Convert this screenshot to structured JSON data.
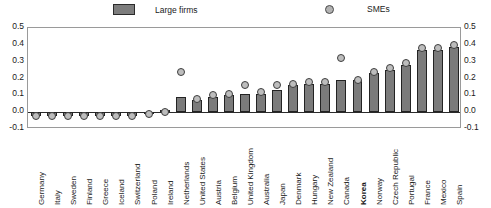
{
  "chart_data": {
    "type": "bar",
    "title": "",
    "subtitle": "",
    "xlabel": "",
    "ylabel": "",
    "ylim": [
      -0.1,
      0.5
    ],
    "yticks": [
      0.5,
      0.4,
      0.3,
      0.2,
      0.1,
      0.0,
      -0.1
    ],
    "ytick_labels": [
      "0.5",
      "0.4",
      "0.3",
      "0.2",
      "0.1",
      "0.0",
      "-0.1"
    ],
    "ytick_labels_right": [
      "0.5",
      "0.4",
      "0.3",
      "0.2",
      "0.1",
      "0.0",
      "-0.1"
    ],
    "grid": false,
    "dual_axis": true,
    "legend_position": "top",
    "categories": [
      "Germany",
      "Italy",
      "Sweden",
      "Finland",
      "Greece",
      "Iceland",
      "Switzerland",
      "Poland",
      "Ireland",
      "Netherlands",
      "United States",
      "Austria",
      "Belgium",
      "United Kingdom",
      "Australia",
      "Japan",
      "Denmark",
      "Hungary",
      "New Zealand",
      "Canada",
      "Korea",
      "Norway",
      "Czech Republic",
      "Portugal",
      "France",
      "Mexico",
      "Spain"
    ],
    "highlighted_categories": [
      "Korea"
    ],
    "series": [
      {
        "name": "Large firms",
        "type": "bar",
        "color": "#7b7b7b",
        "edge_color": "#232323",
        "values": [
          -0.02,
          -0.02,
          -0.02,
          -0.02,
          -0.02,
          -0.02,
          -0.02,
          -0.01,
          0.01,
          0.09,
          0.07,
          0.09,
          0.1,
          0.11,
          0.11,
          0.13,
          0.16,
          0.17,
          0.17,
          0.19,
          0.19,
          0.23,
          0.25,
          0.28,
          0.37,
          0.37,
          0.39
        ]
      },
      {
        "name": "SMEs",
        "type": "scatter",
        "color": "#bdbdbd",
        "edge_color": "#3d3d3d",
        "marker": "circle",
        "values": [
          -0.02,
          -0.02,
          -0.02,
          -0.02,
          -0.02,
          -0.02,
          -0.02,
          -0.01,
          0.0,
          0.24,
          0.08,
          0.1,
          0.11,
          0.16,
          0.12,
          0.16,
          0.17,
          0.18,
          0.18,
          0.32,
          0.19,
          0.24,
          0.26,
          0.29,
          0.38,
          0.38,
          0.4
        ]
      }
    ]
  },
  "legend": {
    "items": [
      {
        "label": "Large firms",
        "kind": "swatch"
      },
      {
        "label": "SMEs",
        "kind": "marker"
      }
    ]
  }
}
